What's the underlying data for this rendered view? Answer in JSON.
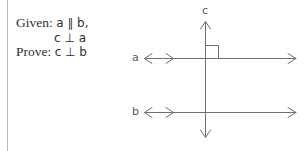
{
  "document": {
    "type": "geometry-proof-setup",
    "background_color": "#ffffff"
  },
  "statement": {
    "given_label": "Given:",
    "given_line_1": "a ∥ b,",
    "given_line_2": "c ⊥ a",
    "prove_label": "Prove:",
    "prove_line": "c ⊥ b",
    "text_color": "#2f2f33"
  },
  "diagram": {
    "line_color": "#6f6f74",
    "label_color": "#5a5a5f",
    "labels": {
      "line_a": "a",
      "line_b": "b",
      "line_c": "c"
    },
    "elements": {
      "line_a_name": "horizontal-line-a",
      "line_b_name": "horizontal-line-b",
      "line_c_name": "vertical-line-c",
      "right_angle_name": "right-angle-marker"
    },
    "relations": {
      "parallel": "a ∥ b",
      "perpendicular_1": "c ⊥ a",
      "perpendicular_2": "c ⊥ b"
    }
  }
}
